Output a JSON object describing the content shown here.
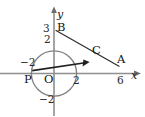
{
  "figure": {
    "kind": "coordinate-geometry-diagram",
    "axes": {
      "x_axis_label": "x",
      "y_axis_label": "y",
      "origin_label": "O",
      "x_ticks": [
        {
          "label": "−2",
          "value": -2
        },
        {
          "label": "2",
          "value": 2
        },
        {
          "label": "6",
          "value": 6
        }
      ],
      "y_ticks": [
        {
          "label": "3",
          "value": 3
        },
        {
          "label": "2",
          "value": 2
        },
        {
          "label": "−2",
          "value": -2
        }
      ]
    },
    "points": [
      {
        "label": "B",
        "x": 0,
        "y": 3
      },
      {
        "label": "C",
        "x": 2.9,
        "y": 1.1
      },
      {
        "label": "A",
        "x": 6,
        "y": 0
      },
      {
        "label": "P",
        "x": -2,
        "y": -0.25
      },
      {
        "label": "O",
        "x": 0,
        "y": 0
      }
    ],
    "shapes": {
      "circle": {
        "center_x": 0,
        "center_y": 0,
        "radius": 2
      },
      "segment_BA": {
        "from": "B",
        "to": "A"
      },
      "vector_PC": {
        "from": "P",
        "to": "C",
        "arrow": true
      }
    },
    "colors": {
      "stroke": "#262626",
      "axis": "#8a8a8a",
      "circle": "#7e7e7e",
      "text": "#1a1a1a",
      "background": "#ffffff"
    }
  }
}
